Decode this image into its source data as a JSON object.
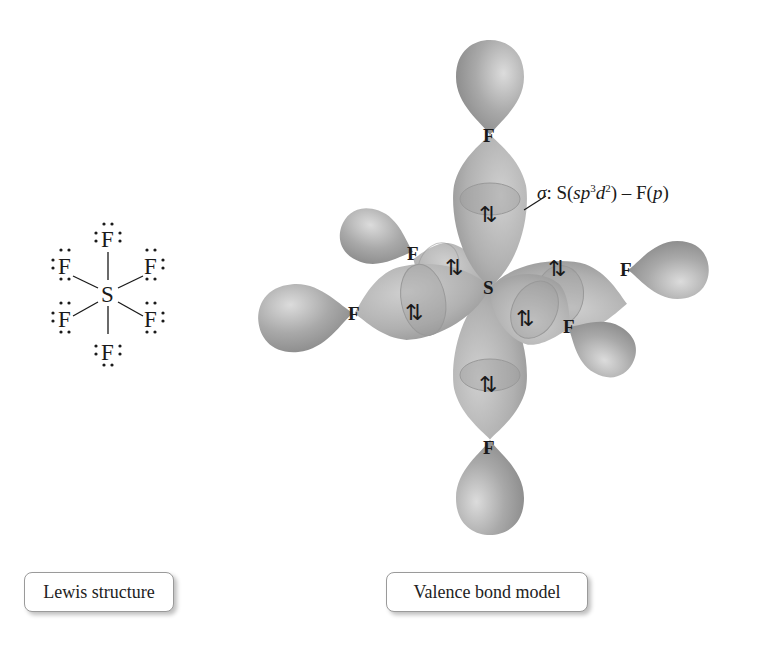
{
  "figure": {
    "lewis": {
      "central_atom": "S",
      "ligand_atom": "F",
      "ligand_count": 6,
      "caption": "Lewis structure"
    },
    "valence_bond": {
      "central_atom": "S",
      "ligand_atom": "F",
      "bond_electron_symbol": "⇅",
      "caption": "Valence bond model",
      "annotation": {
        "sigma": "σ",
        "colon": ":",
        "text_prefix": " S(",
        "sp": "sp",
        "sup1": "3",
        "d": "d",
        "sup2": "2",
        "text_mid": ") – F(",
        "p": "p",
        "text_end": ")"
      }
    },
    "colors": {
      "lobe_fill": "#a8a8a8",
      "lobe_light": "#d6d6d6",
      "lobe_dark": "#8c8c8c",
      "text": "#1a1a1a",
      "caption_border": "#9a9a9a"
    }
  }
}
